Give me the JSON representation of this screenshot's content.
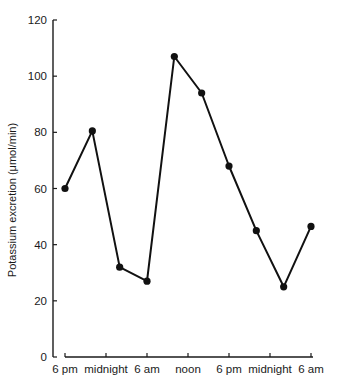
{
  "chart_data": {
    "type": "line",
    "title": "",
    "xlabel": "",
    "ylabel": "Potassium excretion (μmol/min)",
    "ylim": [
      0,
      120
    ],
    "yticks": [
      0,
      20,
      40,
      60,
      80,
      100,
      120
    ],
    "xtick_labels": [
      "6 pm",
      "midnight",
      "6 am",
      "noon",
      "6 pm",
      "midnight",
      "6 am"
    ],
    "grid": false,
    "legend": null,
    "series": [
      {
        "name": "Potassium excretion",
        "marker": "filled-circle",
        "color": "#111111",
        "points": [
          {
            "x_hours": 0,
            "y": 60
          },
          {
            "x_hours": 4,
            "y": 80.5
          },
          {
            "x_hours": 8,
            "y": 32
          },
          {
            "x_hours": 12,
            "y": 27
          },
          {
            "x_hours": 16,
            "y": 107
          },
          {
            "x_hours": 20,
            "y": 94
          },
          {
            "x_hours": 24,
            "y": 68
          },
          {
            "x_hours": 28,
            "y": 45
          },
          {
            "x_hours": 32,
            "y": 25
          },
          {
            "x_hours": 36,
            "y": 46.5
          }
        ]
      }
    ]
  }
}
